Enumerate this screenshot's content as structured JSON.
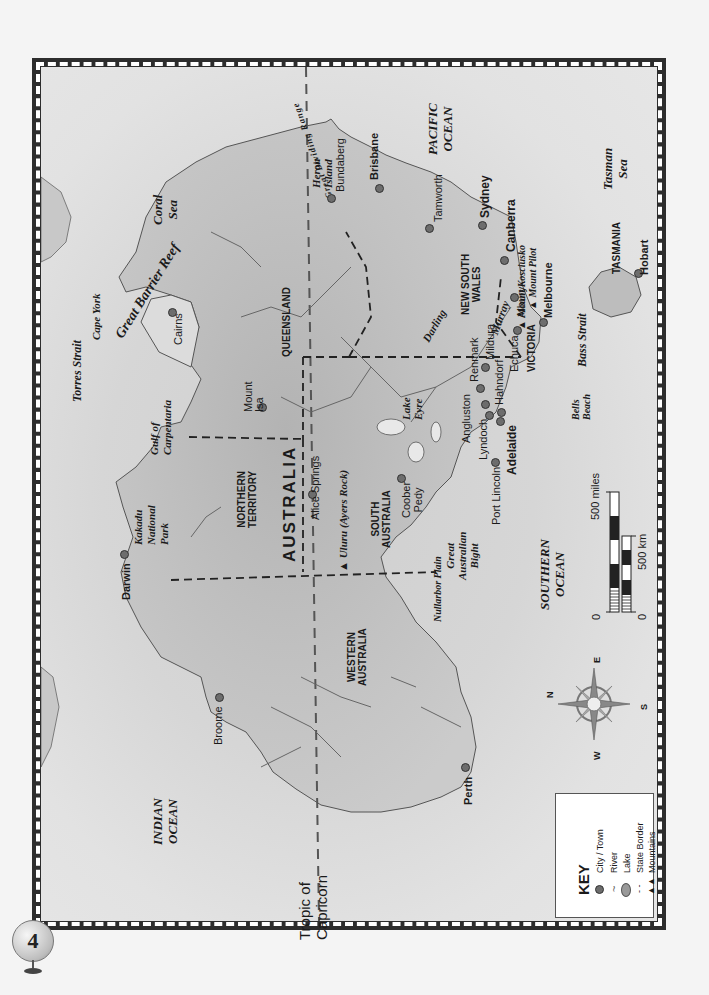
{
  "page": {
    "number": "4"
  },
  "map": {
    "title": "AUSTRALIA",
    "orientation_note": "rotated",
    "states": [
      {
        "id": "wa",
        "label": "WESTERN\nAUSTRALIA",
        "line1": "WESTERN",
        "line2": "AUSTRALIA"
      },
      {
        "id": "nt",
        "label": "NORTHERN\nTERRITORY",
        "line1": "NORTHERN",
        "line2": "TERRITORY"
      },
      {
        "id": "sa",
        "label": "SOUTH\nAUSTRALIA",
        "line1": "SOUTH",
        "line2": "AUSTRALIA"
      },
      {
        "id": "qld",
        "label": "QUEENSLAND",
        "line1": "QUEENSLAND"
      },
      {
        "id": "nsw",
        "label": "NEW SOUTH\nWALES",
        "line1": "NEW SOUTH",
        "line2": "WALES"
      },
      {
        "id": "vic",
        "label": "VICTORIA",
        "line1": "VICTORIA"
      },
      {
        "id": "tas",
        "label": "TASMANIA",
        "line1": "TASMANIA"
      }
    ],
    "cities": [
      {
        "name": "Darwin",
        "bold": true
      },
      {
        "name": "Broome",
        "bold": false
      },
      {
        "name": "Perth",
        "bold": true
      },
      {
        "name": "Alice Springs",
        "bold": false
      },
      {
        "name": "Mount Isa",
        "line1": "Mount",
        "line2": "Isa",
        "bold": false
      },
      {
        "name": "Cairns",
        "bold": false
      },
      {
        "name": "Bundaberg",
        "bold": false
      },
      {
        "name": "Brisbane",
        "bold": true
      },
      {
        "name": "Tamworth",
        "bold": false
      },
      {
        "name": "Sydney",
        "bold": true
      },
      {
        "name": "Canberra",
        "bold": true
      },
      {
        "name": "Albury",
        "bold": false
      },
      {
        "name": "Melbourne",
        "bold": true
      },
      {
        "name": "Echuca",
        "bold": false
      },
      {
        "name": "Mildura",
        "bold": false
      },
      {
        "name": "Renmark",
        "bold": false
      },
      {
        "name": "Hahndorf",
        "bold": false
      },
      {
        "name": "Angluston",
        "bold": false
      },
      {
        "name": "Lyndoch",
        "bold": false
      },
      {
        "name": "Adelaide",
        "bold": true
      },
      {
        "name": "Port Lincoln",
        "bold": false
      },
      {
        "name": "Coober Pedy",
        "line1": "Coober",
        "line2": "Pedy",
        "bold": false
      },
      {
        "name": "Hobart",
        "bold": true
      }
    ],
    "water": [
      {
        "name": "INDIAN OCEAN",
        "line1": "INDIAN",
        "line2": "OCEAN"
      },
      {
        "name": "PACIFIC OCEAN",
        "line1": "PACIFIC",
        "line2": "OCEAN"
      },
      {
        "name": "SOUTHERN OCEAN",
        "line1": "SOUTHERN",
        "line2": "OCEAN"
      },
      {
        "name": "Coral Sea",
        "line1": "Coral",
        "line2": "Sea"
      },
      {
        "name": "Tasman Sea",
        "line1": "Tasman",
        "line2": "Sea"
      },
      {
        "name": "Gulf of Carpentaria",
        "line1": "Gulf of",
        "line2": "Carpentaria"
      },
      {
        "name": "Great Australian Bight",
        "line1": "Great",
        "line2": "Australian",
        "line3": "Bight"
      },
      {
        "name": "Torres Strait"
      },
      {
        "name": "Bass Strait"
      },
      {
        "name": "Great Barrier Reef"
      }
    ],
    "features": [
      {
        "name": "Kakadu National Park",
        "line1": "Kakadu",
        "line2": "National",
        "line3": "Park"
      },
      {
        "name": "Uluru (Ayers Rock)"
      },
      {
        "name": "Lake Eyre",
        "line1": "Lake",
        "line2": "Eyre"
      },
      {
        "name": "Nullarbor Plain"
      },
      {
        "name": "Cape York"
      },
      {
        "name": "Heron Island",
        "line1": "Heron",
        "line2": "Island"
      },
      {
        "name": "Great Dividing Range"
      },
      {
        "name": "Mount Kosciusko"
      },
      {
        "name": "Mount Pilot"
      },
      {
        "name": "Bells Beach",
        "line1": "Bells",
        "line2": "Beach"
      },
      {
        "name": "Darling"
      },
      {
        "name": "Murray"
      },
      {
        "name": "Tropic of Capricorn",
        "line1": "Tropic of",
        "line2": "Capricorn"
      }
    ]
  },
  "compass": {
    "n": "N",
    "e": "E",
    "s": "S",
    "w": "W"
  },
  "scale": {
    "miles_zero": "0",
    "miles_max": "500 miles",
    "km_zero": "0",
    "km_max": "500 km"
  },
  "key": {
    "title": "KEY",
    "items": [
      {
        "icon": "city-dot",
        "label": "City / Town"
      },
      {
        "icon": "river-line",
        "label": "River"
      },
      {
        "icon": "lake-shape",
        "label": "Lake"
      },
      {
        "icon": "state-border",
        "label": "State Border"
      },
      {
        "icon": "mountains",
        "label": "Mountains"
      }
    ]
  },
  "colors": {
    "border_dark": "#2d2d2d",
    "sea": "#e0e0e0",
    "land": "#bdbdbd",
    "city_dot": "#6d6d6d",
    "text": "#1a1a1a"
  }
}
